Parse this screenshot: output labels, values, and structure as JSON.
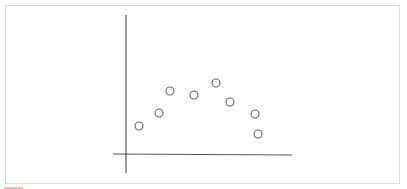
{
  "chart_data": {
    "type": "scatter",
    "title": "",
    "xlabel": "",
    "ylabel": "",
    "x_tick_labels": [],
    "y_tick_labels": [],
    "grid": false,
    "legend": null,
    "xlim": [
      -13,
      166
    ],
    "ylim": [
      -19,
      139
    ],
    "series": [
      {
        "name": "points",
        "marker": "open-circle",
        "x": [
          13,
          33,
          44,
          68,
          90,
          104,
          129,
          132
        ],
        "y": [
          28,
          41,
          63,
          59,
          71,
          52,
          40,
          20
        ]
      }
    ],
    "note": "Values estimated in pixel units relative to axis intersection; no scale is shown."
  },
  "style": {
    "axis_color": "#555555",
    "marker_stroke": "#666666",
    "border_color": "#e6d3d6"
  }
}
